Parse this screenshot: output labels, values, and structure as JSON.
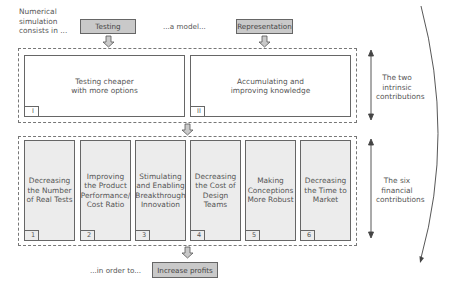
{
  "header": {
    "intro_text": "Numerical\nsimulation\nconsists in ...",
    "testing_label": "Testing",
    "middle_text": "...a model...",
    "representation_label": "Representation"
  },
  "intrinsic": {
    "side_label": "The two\nintrinsic\ncontributions",
    "items": [
      {
        "number": "I",
        "text": "Testing cheaper\nwith more options"
      },
      {
        "number": "II",
        "text": "Accumulating and\nimproving knowledge"
      }
    ]
  },
  "financial": {
    "side_label": "The six\nfinancial\ncontributions",
    "items": [
      {
        "number": "1",
        "text": "Decreasing\nthe Number\nof Real Tests"
      },
      {
        "number": "2",
        "text": "Improving\nthe Product\nPerformance/\nCost Ratio"
      },
      {
        "number": "3",
        "text": "Stimulating\nand Enabling\nBreakthrough\nInnovation"
      },
      {
        "number": "4",
        "text": "Decreasing\nthe Cost of\nDesign Teams"
      },
      {
        "number": "5",
        "text": "Making\nConceptions\nMore Robust"
      },
      {
        "number": "6",
        "text": "Decreasing\nthe Time to\nMarket"
      }
    ]
  },
  "footer": {
    "lead_text": "...in order to...",
    "goal_label": "Increase profits"
  },
  "colors": {
    "gray_box": "#c9c9c9",
    "small_box_fill": "#ececec",
    "stroke": "#666666"
  }
}
